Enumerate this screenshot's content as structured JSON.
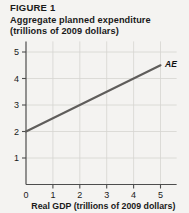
{
  "figure": {
    "label": "FIGURE 1",
    "title_line1": "Aggregate planned expenditure",
    "title_line2": "(trillions of 2009 dollars)"
  },
  "chart_data": {
    "type": "line",
    "title": "Aggregate planned expenditure (trillions of 2009 dollars)",
    "xlabel": "Real GDP (trillions of 2009 dollars)",
    "ylabel": "Aggregate planned expenditure (trillions of 2009 dollars)",
    "xlim": [
      0,
      5.6
    ],
    "ylim": [
      0,
      5.4
    ],
    "xticks": [
      0,
      1,
      2,
      3,
      4,
      5
    ],
    "xtick_labels": [
      "0",
      "1",
      "2",
      "3",
      "4",
      "5"
    ],
    "yticks": [
      1,
      2,
      3,
      4,
      5
    ],
    "ytick_labels": [
      "1",
      "2",
      "3",
      "4",
      "5"
    ],
    "origin_label": "0",
    "grid": true,
    "legend": "none",
    "series": [
      {
        "name": "AE",
        "label": "AE",
        "color": "#5f5d5b",
        "intercept": 2.0,
        "slope": 0.5,
        "x": [
          0,
          5
        ],
        "values": [
          2.0,
          4.5
        ],
        "points": [
          [
            0,
            2.0
          ],
          [
            1,
            2.5
          ],
          [
            2,
            3.0
          ],
          [
            3,
            3.5
          ],
          [
            4,
            4.0
          ],
          [
            5,
            4.5
          ]
        ]
      }
    ]
  },
  "axes": {
    "x_axis_title": "Real GDP (trillions of 2009 dollars)"
  },
  "colors": {
    "background": "#f4f3f1",
    "axis": "#4d4d4d",
    "grid": "#d6d4d1",
    "ae_line": "#5f5d5b",
    "text": "#1a1a1a"
  }
}
